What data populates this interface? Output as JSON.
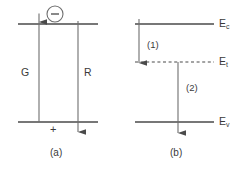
{
  "figure": {
    "type": "band-diagram",
    "width": 244,
    "height": 171,
    "line_color": "#4a4a4a",
    "text_color": "#3a3a3a",
    "background": "#ffffff"
  },
  "panel_a": {
    "caption": "(a)",
    "generation_label": "G",
    "recombination_label": "R",
    "electron_symbol": "−",
    "hole_symbol": "+",
    "top_band": {
      "y": 24,
      "x1": 18,
      "x2": 98
    },
    "bottom_band": {
      "y": 122,
      "x1": 18,
      "x2": 98
    },
    "generation_arrow": {
      "x": 39,
      "y_from": 122,
      "y_to": 14,
      "direction": "up"
    },
    "recombination_arrow": {
      "x": 78,
      "y_from": 24,
      "y_to": 132,
      "direction": "down"
    },
    "electron_circle": {
      "cx": 55,
      "cy": 14,
      "r": 8
    }
  },
  "panel_b": {
    "caption": "(b)",
    "levels": [
      {
        "name": "Ec",
        "label": "E",
        "subscript": "c",
        "y": 24,
        "style": "solid",
        "x1": 135,
        "x2": 214
      },
      {
        "name": "Et",
        "label": "E",
        "subscript": "t",
        "y": 62,
        "style": "dashed",
        "x1": 135,
        "x2": 214
      },
      {
        "name": "Ev",
        "label": "E",
        "subscript": "v",
        "y": 122,
        "style": "solid",
        "x1": 135,
        "x2": 214
      }
    ],
    "transitions": [
      {
        "id": "1",
        "label": "(1)",
        "x": 139,
        "y_from": 19,
        "y_to": 62,
        "direction": "down"
      },
      {
        "id": "2",
        "label": "(2)",
        "x": 178,
        "y_from": 62,
        "y_to": 133,
        "direction": "down"
      }
    ]
  }
}
